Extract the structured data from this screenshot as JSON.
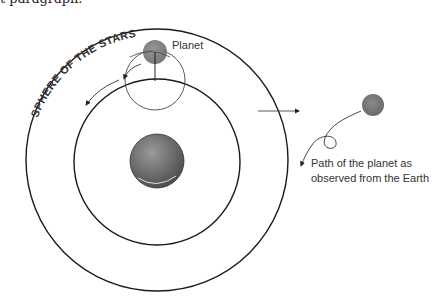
{
  "intro_text": "t paragraph.",
  "diagram": {
    "sphere_label": "SPHERE OF THE STARS",
    "planet_label": "Planet",
    "caption": {
      "line1": "Path of the planet as",
      "line2": "observed from the Earth"
    }
  },
  "colors": {
    "stroke": "#1a1a1a",
    "thin_stroke": "#444444",
    "planet": "#7a7a7a",
    "earth": "#6e6e6e"
  }
}
